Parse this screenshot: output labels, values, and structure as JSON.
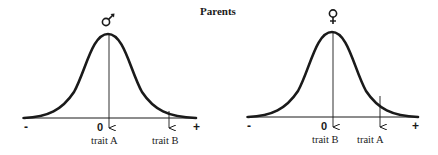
{
  "title": "Parents",
  "colors": {
    "ink": "#1a1a1a",
    "background": "#ffffff"
  },
  "panels": [
    {
      "sex": "male",
      "symbol_icon": "male-symbol-icon",
      "axis": {
        "minus_label": "-",
        "zero_label": "0",
        "plus_label": "+"
      },
      "markers": [
        {
          "label": "trait A",
          "position": "mean"
        },
        {
          "label": "trait B",
          "position": "right-tail"
        }
      ]
    },
    {
      "sex": "female",
      "symbol_icon": "female-symbol-icon",
      "axis": {
        "minus_label": "-",
        "zero_label": "0",
        "plus_label": "+"
      },
      "markers": [
        {
          "label": "trait B",
          "position": "mean"
        },
        {
          "label": "trait A",
          "position": "right-tail"
        }
      ]
    }
  ]
}
